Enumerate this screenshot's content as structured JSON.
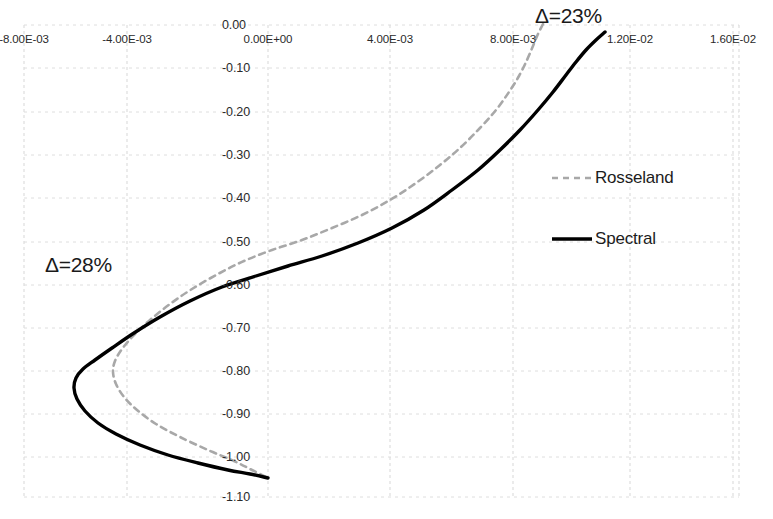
{
  "chart_data": {
    "type": "line",
    "title": "",
    "xlabel": "",
    "ylabel": "",
    "xlim": [
      -0.01,
      0.018
    ],
    "ylim": [
      -1.1,
      0.0
    ],
    "grid": true,
    "x_ticks": [
      {
        "label": "-8.00E-03",
        "value": -0.008,
        "px": 24
      },
      {
        "label": "-4.00E-03",
        "value": -0.004,
        "px": 127
      },
      {
        "label": "0.00E+00",
        "value": 0.0,
        "px": 268
      },
      {
        "label": "4.00E-03",
        "value": 0.004,
        "px": 390
      },
      {
        "label": "8.00E-03",
        "value": 0.008,
        "px": 513
      },
      {
        "label": "1.20E-02",
        "value": 0.012,
        "px": 630
      },
      {
        "label": "1.60E-02",
        "value": 0.016,
        "px": 733
      }
    ],
    "y_ticks": [
      {
        "label": "0.00",
        "value": 0.0,
        "px": 25
      },
      {
        "label": "-0.10",
        "value": -0.1,
        "px": 68
      },
      {
        "label": "-0.20",
        "value": -0.2,
        "px": 112
      },
      {
        "label": "-0.30",
        "value": -0.3,
        "px": 155
      },
      {
        "label": "-0.40",
        "value": -0.4,
        "px": 198
      },
      {
        "label": "-0.50",
        "value": -0.5,
        "px": 242
      },
      {
        "label": "-0.60",
        "value": -0.6,
        "px": 285
      },
      {
        "label": "-0.70",
        "value": -0.7,
        "px": 328
      },
      {
        "label": "-0.80",
        "value": -0.8,
        "px": 371
      },
      {
        "label": "-0.90",
        "value": -0.9,
        "px": 414
      },
      {
        "label": "-1.00",
        "value": -1.0,
        "px": 457
      },
      {
        "label": "-1.10",
        "value": -1.1,
        "px": 497
      }
    ],
    "legend": {
      "position": "right-middle",
      "entries": [
        {
          "name": "Rosseland",
          "style": "dashed",
          "color": "#a8a8a8"
        },
        {
          "name": "Spectral",
          "style": "solid",
          "color": "#000000"
        }
      ]
    },
    "annotations": [
      {
        "text": "Δ=23%",
        "x_px": 535,
        "y_px": 4
      },
      {
        "text": "Δ=28%",
        "x_px": 45,
        "y_px": 253
      }
    ],
    "series": [
      {
        "name": "Spectral",
        "style": "solid",
        "color": "#000000",
        "points_px": [
          [
            605,
            32
          ],
          [
            596,
            40
          ],
          [
            586,
            50
          ],
          [
            576,
            62
          ],
          [
            566,
            75
          ],
          [
            553,
            92
          ],
          [
            538,
            110
          ],
          [
            520,
            130
          ],
          [
            500,
            150
          ],
          [
            478,
            170
          ],
          [
            452,
            190
          ],
          [
            424,
            210
          ],
          [
            392,
            228
          ],
          [
            358,
            243
          ],
          [
            322,
            256
          ],
          [
            288,
            266
          ],
          [
            256,
            276
          ],
          [
            222,
            287
          ],
          [
            190,
            301
          ],
          [
            160,
            317
          ],
          [
            134,
            333
          ],
          [
            112,
            348
          ],
          [
            95,
            360
          ],
          [
            83,
            369
          ],
          [
            76,
            378
          ],
          [
            74,
            388
          ],
          [
            77,
            399
          ],
          [
            85,
            411
          ],
          [
            98,
            423
          ],
          [
            116,
            434
          ],
          [
            140,
            445
          ],
          [
            168,
            455
          ],
          [
            198,
            463
          ],
          [
            228,
            470
          ],
          [
            250,
            474
          ],
          [
            268,
            478
          ]
        ]
      },
      {
        "name": "Rosseland",
        "style": "dashed",
        "color": "#a8a8a8",
        "points_px": [
          [
            543,
            24
          ],
          [
            538,
            34
          ],
          [
            533,
            46
          ],
          [
            527,
            60
          ],
          [
            519,
            76
          ],
          [
            509,
            92
          ],
          [
            496,
            110
          ],
          [
            480,
            128
          ],
          [
            461,
            147
          ],
          [
            440,
            165
          ],
          [
            416,
            183
          ],
          [
            390,
            200
          ],
          [
            362,
            215
          ],
          [
            332,
            228
          ],
          [
            302,
            240
          ],
          [
            272,
            250
          ],
          [
            244,
            261
          ],
          [
            218,
            274
          ],
          [
            192,
            289
          ],
          [
            170,
            304
          ],
          [
            150,
            320
          ],
          [
            134,
            335
          ],
          [
            122,
            349
          ],
          [
            115,
            361
          ],
          [
            113,
            372
          ],
          [
            116,
            384
          ],
          [
            124,
            397
          ],
          [
            137,
            410
          ],
          [
            156,
            424
          ],
          [
            180,
            437
          ],
          [
            208,
            450
          ],
          [
            234,
            461
          ],
          [
            252,
            470
          ],
          [
            268,
            478
          ]
        ]
      }
    ]
  },
  "plot_area": {
    "left_px": 24,
    "right_px": 739,
    "top_px": 25,
    "bottom_px": 497
  }
}
